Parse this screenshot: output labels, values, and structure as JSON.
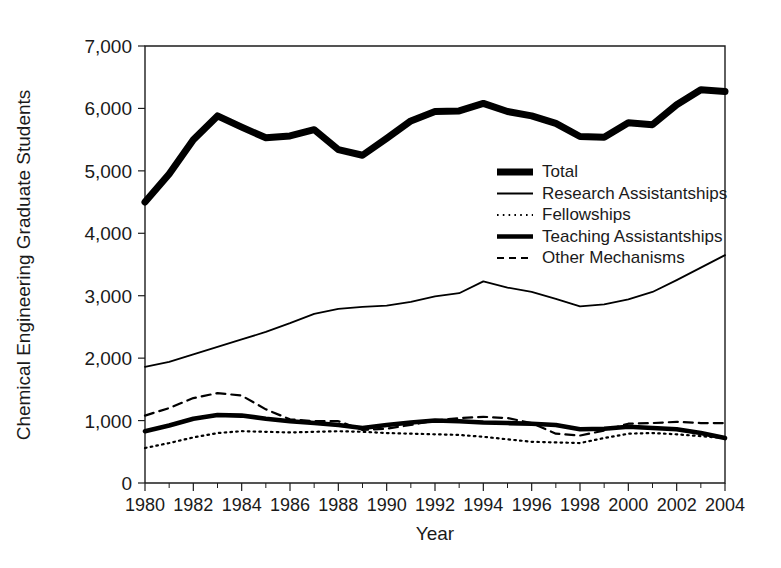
{
  "chart_data": {
    "type": "line",
    "title": "",
    "xlabel": "Year",
    "ylabel": "Chemical Engineering Graduate Students",
    "xlim": [
      1980,
      2004
    ],
    "ylim": [
      0,
      7000
    ],
    "grid": false,
    "legend_position": "center-right",
    "x": [
      1980,
      1981,
      1982,
      1983,
      1984,
      1985,
      1986,
      1987,
      1988,
      1989,
      1990,
      1991,
      1992,
      1993,
      1994,
      1995,
      1996,
      1997,
      1998,
      1999,
      2000,
      2001,
      2002,
      2003,
      2004
    ],
    "xtick_labels": [
      "1980",
      "1982",
      "1984",
      "1986",
      "1988",
      "1990",
      "1992",
      "1994",
      "1996",
      "1998",
      "2000",
      "2002",
      "2004"
    ],
    "xticks": [
      1980,
      1982,
      1984,
      1986,
      1988,
      1990,
      1992,
      1994,
      1996,
      1998,
      2000,
      2002,
      2004
    ],
    "ytick_labels": [
      "0",
      "1,000",
      "2,000",
      "3,000",
      "4,000",
      "5,000",
      "6,000",
      "7,000"
    ],
    "yticks": [
      0,
      1000,
      2000,
      3000,
      4000,
      5000,
      6000,
      7000
    ],
    "series": [
      {
        "name": "Total",
        "style": "thick-solid",
        "color": "#000000",
        "values": [
          4500,
          4950,
          5500,
          5880,
          5700,
          5530,
          5560,
          5660,
          5340,
          5250,
          5520,
          5800,
          5950,
          5960,
          6080,
          5950,
          5880,
          5760,
          5550,
          5540,
          5770,
          5740,
          6060,
          6300,
          6270
        ]
      },
      {
        "name": "Research Assistantships",
        "style": "thin-solid",
        "color": "#000000",
        "values": [
          1860,
          1940,
          2060,
          2180,
          2300,
          2420,
          2560,
          2710,
          2790,
          2820,
          2840,
          2900,
          2990,
          3040,
          3230,
          3130,
          3060,
          2950,
          2830,
          2860,
          2940,
          3060,
          3250,
          3450,
          3650
        ]
      },
      {
        "name": "Fellowships",
        "style": "dotted",
        "color": "#000000",
        "values": [
          560,
          640,
          730,
          800,
          830,
          820,
          810,
          820,
          830,
          820,
          800,
          790,
          780,
          770,
          740,
          700,
          660,
          650,
          640,
          720,
          790,
          800,
          780,
          750,
          720
        ]
      },
      {
        "name": "Teaching Assistantships",
        "style": "medium-solid",
        "color": "#000000",
        "values": [
          830,
          920,
          1030,
          1090,
          1080,
          1030,
          990,
          960,
          930,
          880,
          930,
          970,
          1000,
          990,
          970,
          960,
          950,
          930,
          860,
          870,
          900,
          880,
          860,
          800,
          720
        ]
      },
      {
        "name": "Other Mechanisms",
        "style": "dashed",
        "color": "#000000",
        "values": [
          1080,
          1200,
          1360,
          1440,
          1400,
          1180,
          1020,
          990,
          990,
          850,
          870,
          930,
          1000,
          1040,
          1060,
          1040,
          960,
          790,
          760,
          840,
          950,
          960,
          980,
          960,
          960
        ]
      }
    ],
    "legend": [
      {
        "label": "Total",
        "style": "thick-solid"
      },
      {
        "label": "Research Assistantships",
        "style": "thin-solid"
      },
      {
        "label": "Fellowships",
        "style": "dotted"
      },
      {
        "label": "Teaching Assistantships",
        "style": "medium-solid"
      },
      {
        "label": "Other Mechanisms",
        "style": "dashed"
      }
    ]
  }
}
